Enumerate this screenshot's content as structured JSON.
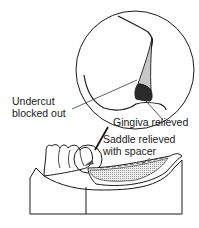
{
  "labels": {
    "undercut_line1": "Undercut",
    "undercut_line2": "blocked out",
    "gingiva": "Gingiva relieved",
    "saddle_line1": "Saddle relieved",
    "saddle_line2": "with spacer"
  },
  "colors": {
    "stroke": "#1a1a1a",
    "blockout_fill": "#c8c8c8",
    "gingiva_fill": "#2a2a2a",
    "spacer_fill": "#d6d6d6"
  }
}
